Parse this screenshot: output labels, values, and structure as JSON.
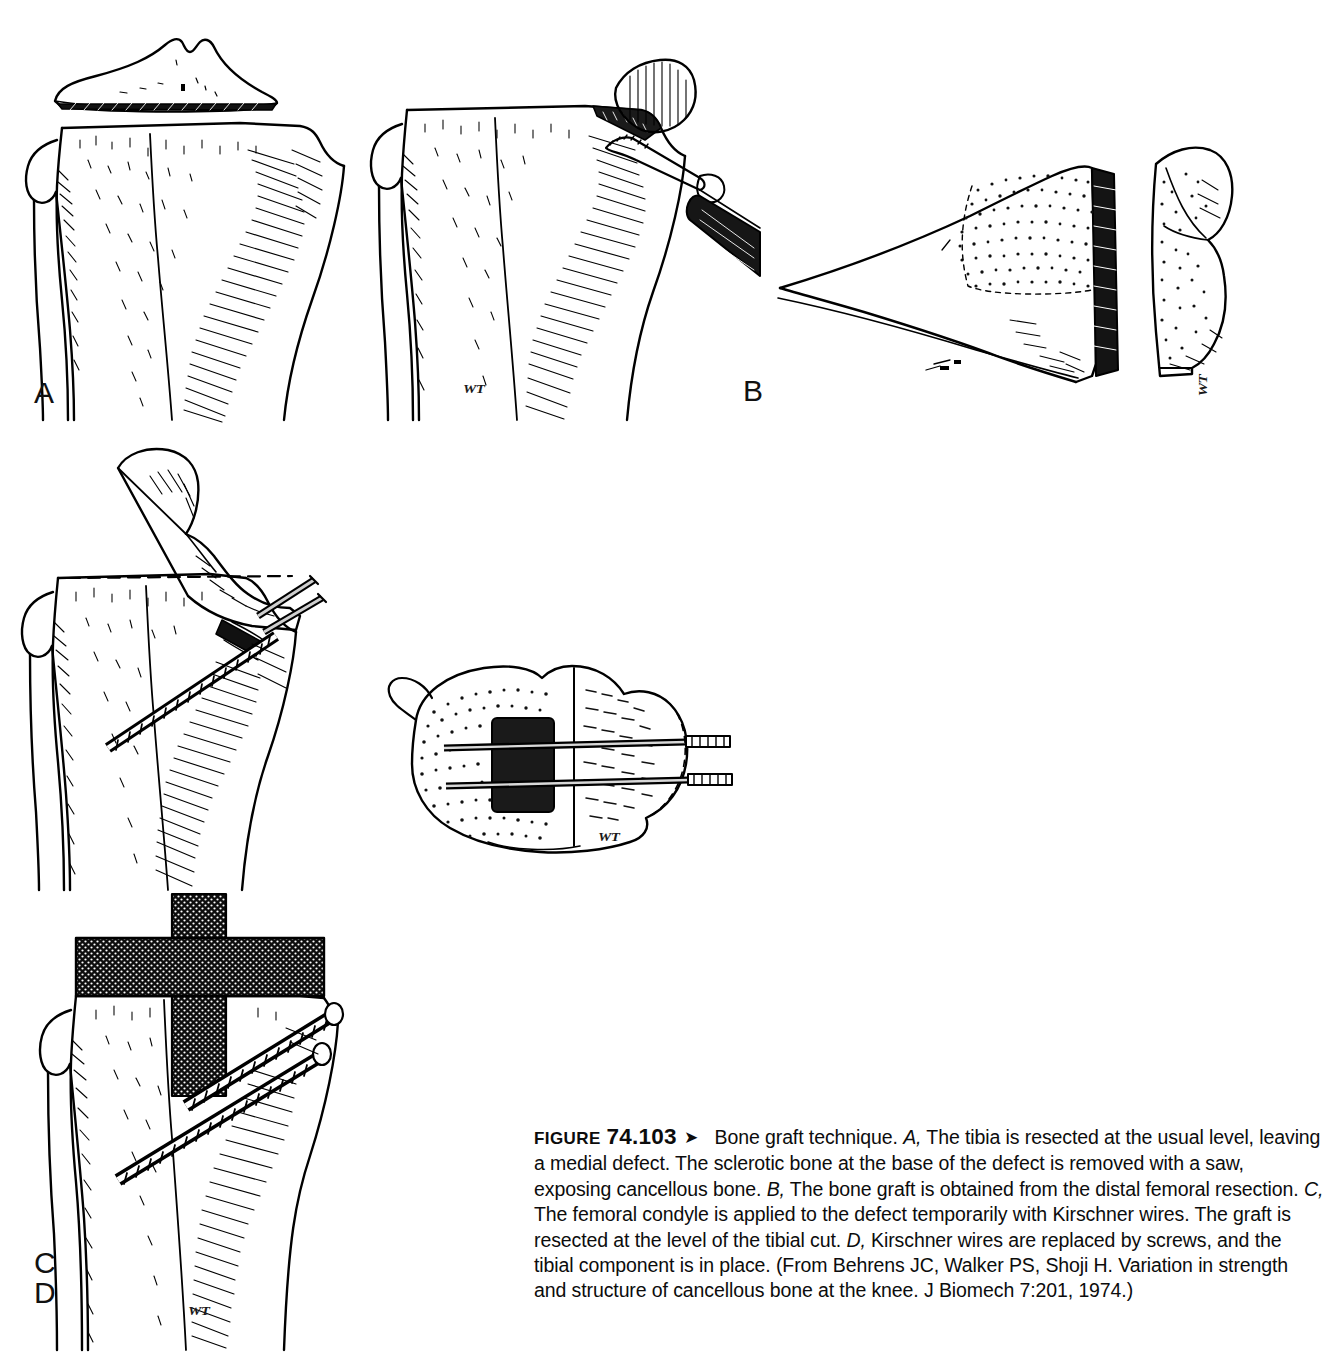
{
  "figure": {
    "label_word": "FIGURE",
    "number": "74.103",
    "arrow_glyph": "➤",
    "title": "Bone graft technique.",
    "caption_segments": [
      {
        "type": "panel",
        "text": "A,"
      },
      {
        "type": "text",
        "text": " The tibia is resected at the usual level, leaving a medial defect. The sclerotic bone at the base of the defect is removed with a saw, exposing cancellous bone. "
      },
      {
        "type": "panel",
        "text": "B,"
      },
      {
        "type": "text",
        "text": " The bone graft is obtained from the distal femoral resection. "
      },
      {
        "type": "panel",
        "text": "C,"
      },
      {
        "type": "text",
        "text": " The femoral condyle is applied to the defect temporarily with Kirschner wires. The graft is resected at the level of the tibial cut. "
      },
      {
        "type": "panel",
        "text": "D,"
      },
      {
        "type": "text",
        "text": " Kirschner wires are replaced by screws, and the tibial component is in place. (From Behrens JC, Walker PS, Shoji H. Variation in strength and structure of cancellous bone at the knee. J Biomech 7:201, 1974.)"
      }
    ],
    "source_credit": "(From Behrens JC, Walker PS, Shoji H. Variation in strength and structure of cancellous bone at the knee. J Biomech 7:201, 1974.)"
  },
  "panels": [
    {
      "id": "A",
      "letter": "A",
      "description": "Proximal tibia resected at the usual level, leaving a medial defect; resected plateau wafer shown above. Second view: sclerotic bone at the base of the defect removed with an oscillating saw, exposing cancellous bone.",
      "signature": "WT"
    },
    {
      "id": "B",
      "letter": "B",
      "description": "Distal femoral resection in lateral profile with stippled cancellous bone; the bone graft wedge separated at right.",
      "signature": "WT"
    },
    {
      "id": "C",
      "letter": "C",
      "description": "Femoral condyle graft applied to the medial tibial defect, held temporarily with two Kirschner wires; dashed line marks the level of the tibial cut. Axial view of the tibial plateau shows the defect and the two transfixing wires.",
      "signature": "WT"
    },
    {
      "id": "D",
      "letter": "D",
      "description": "Kirschner wires replaced by two cancellous screws; the tibial component with its central stem is in place.",
      "signature": "WT"
    }
  ],
  "colors": {
    "page_background": "#ffffff",
    "ink": "#000000",
    "caption_text": "#0c0c0c",
    "implant_fill": "#111111",
    "stipple": "#1a1a1a"
  }
}
